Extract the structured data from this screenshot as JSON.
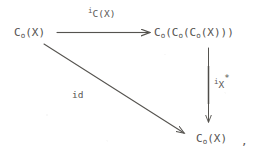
{
  "figure": {
    "kind": "commutative-diagram",
    "ink_color": "#55534f",
    "background_color": "#ffffff",
    "trailing_punctuation": ","
  },
  "nodes": [
    {
      "id": "source",
      "position": "top-left",
      "text": "C (X)",
      "base": "C",
      "subscript": "o",
      "argument": "(X)",
      "full_text": "C_o(X)",
      "x": 14,
      "y": 27
    },
    {
      "id": "triple",
      "position": "top-right",
      "text": "C (C (C (X)))",
      "base": "C",
      "subscript": "o",
      "full_text": "C_o(C_o(C_o(X)))",
      "x": 154,
      "y": 27
    },
    {
      "id": "target",
      "position": "bottom-right",
      "text": "C (X)",
      "base": "C",
      "subscript": "o",
      "argument": "(X)",
      "full_text": "C_o(X)",
      "x": 196,
      "y": 133
    }
  ],
  "arrows": [
    {
      "id": "top-arrow",
      "from": "source",
      "to": "triple",
      "orientation": "horizontal",
      "direction": "right",
      "label": {
        "raised": "i",
        "base": "C(X)",
        "star": "",
        "full_text": "i_C(X)",
        "x": 88,
        "y": 7
      }
    },
    {
      "id": "right-arrow",
      "from": "triple",
      "to": "target",
      "orientation": "vertical",
      "direction": "down",
      "label": {
        "raised": "i",
        "base": "X",
        "star": "*",
        "full_text": "i_X^*",
        "x": 214,
        "y": 74
      }
    },
    {
      "id": "diagonal-arrow",
      "from": "source",
      "to": "target",
      "orientation": "diagonal",
      "direction": "down-right",
      "label": {
        "raised": "",
        "base": "id",
        "star": "",
        "full_text": "id",
        "x": 72,
        "y": 90
      }
    }
  ]
}
